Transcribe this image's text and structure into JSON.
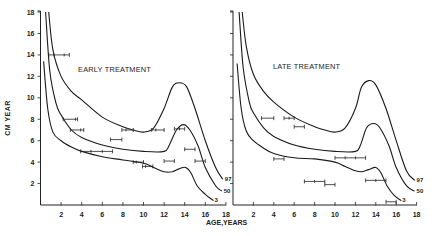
{
  "chart_data": [
    {
      "type": "line",
      "title": "EARLY TREATMENT",
      "xlabel": "AGE,YEARS",
      "ylabel": "CM YEAR",
      "xlim": [
        0,
        18
      ],
      "ylim": [
        0,
        18
      ],
      "xticks": [
        2,
        4,
        6,
        8,
        10,
        12,
        14,
        16,
        18
      ],
      "yticks": [
        2,
        4,
        6,
        8,
        10,
        12,
        14,
        16,
        18
      ],
      "series": [
        {
          "name": "97",
          "x": [
            0.8,
            1.2,
            2,
            3,
            4,
            6,
            8,
            9,
            10,
            11,
            12,
            12.8,
            13.5,
            14.2,
            15,
            16,
            17,
            17.7
          ],
          "y": [
            18,
            14.5,
            12,
            10.6,
            9.8,
            8.2,
            7.3,
            7.0,
            6.8,
            7.2,
            9.0,
            11.0,
            11.4,
            11.0,
            9.0,
            6.0,
            3.5,
            2.4
          ]
        },
        {
          "name": "50",
          "x": [
            0.5,
            0.9,
            1.5,
            2,
            3,
            4,
            6,
            8,
            10,
            12,
            12.5,
            13.2,
            13.9,
            14.5,
            15.3,
            16,
            17,
            17.6
          ],
          "y": [
            18,
            12.5,
            9.5,
            8.4,
            7.0,
            6.3,
            5.6,
            5.2,
            5.0,
            5.0,
            5.6,
            7.0,
            7.5,
            7.0,
            5.5,
            3.5,
            1.8,
            1.3
          ]
        },
        {
          "name": "3",
          "x": [
            0.3,
            0.7,
            1.2,
            2,
            3,
            4,
            6,
            8,
            10,
            11,
            12,
            12.8,
            13.5,
            14.1,
            14.6,
            15.2,
            16,
            16.8
          ],
          "y": [
            13.4,
            9.0,
            6.8,
            6.0,
            5.4,
            5.0,
            4.5,
            4.2,
            3.9,
            3.5,
            3.1,
            3.1,
            3.4,
            3.5,
            3.0,
            1.8,
            1.0,
            0.4
          ]
        }
      ],
      "error_bars": [
        {
          "x_lo": 0.8,
          "x_hi": 2.8,
          "y": 14,
          "marks": [
            1.3,
            2.3
          ]
        },
        {
          "x_lo": 2.2,
          "x_hi": 3.6,
          "y": 8,
          "marks": [
            3.4
          ]
        },
        {
          "x_lo": 2.9,
          "x_hi": 4.2,
          "y": 7,
          "marks": [
            3.9
          ]
        },
        {
          "x_lo": 3.9,
          "x_hi": 7.0,
          "y": 5,
          "marks": [
            4.9,
            6.0
          ]
        },
        {
          "x_lo": 6.8,
          "x_hi": 7.9,
          "y": 6.1,
          "marks": []
        },
        {
          "x_lo": 7.9,
          "x_hi": 9.0,
          "y": 7,
          "marks": [
            8.3
          ]
        },
        {
          "x_lo": 9.0,
          "x_hi": 10.0,
          "y": 4,
          "marks": [
            9.3
          ]
        },
        {
          "x_lo": 9.9,
          "x_hi": 10.9,
          "y": 3.6,
          "marks": [
            10.2
          ]
        },
        {
          "x_lo": 10.8,
          "x_hi": 12.0,
          "y": 7,
          "marks": [
            11.2
          ]
        },
        {
          "x_lo": 12.0,
          "x_hi": 13.0,
          "y": 4.1,
          "marks": []
        },
        {
          "x_lo": 13.0,
          "x_hi": 14.0,
          "y": 7.1,
          "marks": [
            13.5
          ]
        },
        {
          "x_lo": 14.0,
          "x_hi": 15.0,
          "y": 5.2,
          "marks": []
        },
        {
          "x_lo": 15.0,
          "x_hi": 16.0,
          "y": 4.1,
          "marks": []
        }
      ],
      "percentile_labels": [
        "97",
        "50",
        "3"
      ]
    },
    {
      "type": "line",
      "title": "LATE TREATMENT",
      "xlabel": "AGE,YEARS",
      "ylabel": "",
      "xlim": [
        0,
        18
      ],
      "ylim": [
        0,
        18
      ],
      "xticks": [
        2,
        4,
        6,
        8,
        10,
        12,
        14,
        16,
        18
      ],
      "yticks": [
        2,
        4,
        6,
        8,
        10,
        12,
        14,
        16,
        18
      ],
      "series": [
        {
          "name": "97",
          "x": [
            0.9,
            1.3,
            2,
            3,
            4,
            6,
            8,
            9,
            10,
            11,
            12,
            12.6,
            13.3,
            14,
            15,
            16,
            17,
            17.8
          ],
          "y": [
            18,
            14.8,
            12.2,
            10.6,
            9.6,
            8.2,
            7.3,
            7.0,
            6.8,
            7.2,
            9.0,
            11.0,
            11.6,
            11.2,
            9.0,
            6.0,
            3.2,
            2.3
          ]
        },
        {
          "name": "50",
          "x": [
            0.6,
            1.0,
            1.6,
            2,
            3,
            4,
            6,
            8,
            10,
            12,
            12.5,
            13.1,
            13.8,
            14.4,
            15.3,
            16,
            17,
            17.8
          ],
          "y": [
            18,
            12.8,
            9.6,
            8.6,
            7.2,
            6.4,
            5.6,
            5.2,
            5.0,
            5.0,
            5.6,
            7.2,
            7.6,
            7.2,
            5.5,
            3.5,
            1.8,
            1.3
          ]
        },
        {
          "name": "3",
          "x": [
            0.4,
            0.8,
            1.3,
            2,
            3,
            4,
            6,
            8,
            10,
            11,
            12,
            12.6,
            13.3,
            14,
            14.5,
            15.1,
            15.8,
            16.5
          ],
          "y": [
            13.2,
            9.0,
            6.9,
            6.0,
            5.3,
            4.8,
            4.4,
            4.3,
            4.0,
            3.6,
            3.2,
            3.1,
            3.3,
            3.5,
            3.0,
            1.8,
            0.9,
            0.4
          ]
        }
      ],
      "error_bars": [
        {
          "x_lo": 2.8,
          "x_hi": 4.0,
          "y": 8.1,
          "marks": []
        },
        {
          "x_lo": 5.0,
          "x_hi": 6.0,
          "y": 8.1,
          "marks": [
            5.5
          ]
        },
        {
          "x_lo": 6.0,
          "x_hi": 7.0,
          "y": 7.3,
          "marks": []
        },
        {
          "x_lo": 4.0,
          "x_hi": 5.0,
          "y": 4.3,
          "marks": []
        },
        {
          "x_lo": 7.0,
          "x_hi": 9.0,
          "y": 2.2,
          "marks": [
            8.0
          ]
        },
        {
          "x_lo": 9.0,
          "x_hi": 10.0,
          "y": 1.9,
          "marks": []
        },
        {
          "x_lo": 10.0,
          "x_hi": 13.0,
          "y": 4.4,
          "marks": [
            11.0,
            12.0
          ]
        },
        {
          "x_lo": 13.0,
          "x_hi": 15.0,
          "y": 2.3,
          "marks": [
            14.0
          ]
        },
        {
          "x_lo": 15.0,
          "x_hi": 16.0,
          "y": 0.3,
          "marks": []
        }
      ],
      "percentile_labels": [
        "97",
        "50",
        "3"
      ]
    }
  ]
}
